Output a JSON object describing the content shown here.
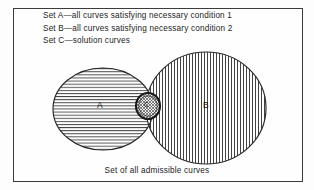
{
  "figure": {
    "legend": [
      "Set A—all curves satisfying necessary condition 1",
      "Set B—all curves satisfying necessary condition 2",
      "Set C—solution curves"
    ],
    "caption": "Set of all admissible curves",
    "labels": {
      "set_a": "A",
      "set_b": "B",
      "set_c": "C"
    },
    "colors": {
      "ink": "#1c1c1c",
      "frame": "#3a3a3a",
      "background": "#fefefe",
      "hatch": "#303030"
    },
    "diagram": {
      "type": "venn",
      "universe_label": "Set of all admissible curves",
      "sets": [
        {
          "name": "A",
          "description": "all curves satisfying necessary condition 1",
          "shape": "ellipse",
          "hatching": "horizontal",
          "center": [
            103,
            109
          ],
          "radii": [
            50,
            41
          ]
        },
        {
          "name": "B",
          "description": "all curves satisfying necessary condition 2",
          "shape": "ellipse",
          "hatching": "vertical",
          "center": [
            206,
            108
          ],
          "radii": [
            60,
            56
          ]
        },
        {
          "name": "C",
          "description": "solution curves",
          "shape": "circle",
          "hatching": "scribble-outline",
          "center": [
            148,
            106
          ],
          "radii": [
            12,
            13
          ],
          "relation": "intersection of A and B"
        }
      ]
    }
  }
}
